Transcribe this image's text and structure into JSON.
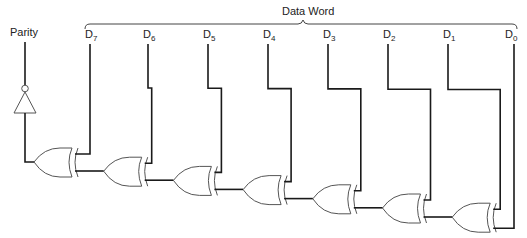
{
  "title": "Data Word",
  "parity_label": "Parity",
  "bits": [
    {
      "name": "D",
      "sub": "7"
    },
    {
      "name": "D",
      "sub": "6"
    },
    {
      "name": "D",
      "sub": "5"
    },
    {
      "name": "D",
      "sub": "4"
    },
    {
      "name": "D",
      "sub": "3"
    },
    {
      "name": "D",
      "sub": "2"
    },
    {
      "name": "D",
      "sub": "1"
    },
    {
      "name": "D",
      "sub": "0"
    }
  ],
  "gates": {
    "type": "XOR",
    "count": 7
  },
  "inverter": {
    "type": "NOT",
    "output": "Parity"
  },
  "colors": {
    "wire": "#1a1a1a",
    "gate_outline": "#555555",
    "text": "#222222"
  }
}
